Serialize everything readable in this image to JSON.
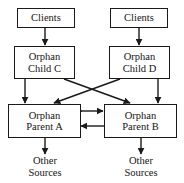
{
  "diagram": {
    "background_color": "#ffffff",
    "stroke_color": "#1a1a1a",
    "text_color": "#141414",
    "nodes": {
      "clients_left": {
        "label": "Clients",
        "boxed": true
      },
      "clients_right": {
        "label": "Clients",
        "boxed": true
      },
      "child_c": {
        "line1": "Orphan",
        "line2": "Child C",
        "boxed": true
      },
      "child_d": {
        "line1": "Orphan",
        "line2": "Child D",
        "boxed": true
      },
      "parent_a": {
        "line1": "Orphan",
        "line2": "Parent A",
        "boxed": true
      },
      "parent_b": {
        "line1": "Orphan",
        "line2": "Parent B",
        "boxed": true
      },
      "sources_left": {
        "line1": "Other",
        "line2": "Sources",
        "boxed": false
      },
      "sources_right": {
        "line1": "Other",
        "line2": "Sources",
        "boxed": false
      }
    },
    "edges": [
      {
        "id": "clients-left-to-child-c",
        "from": "clients_left",
        "to": "child_c",
        "style": "vertical",
        "arrows": "end"
      },
      {
        "id": "clients-right-to-child-d",
        "from": "clients_right",
        "to": "child_d",
        "style": "vertical",
        "arrows": "end"
      },
      {
        "id": "child-c-to-parent-a",
        "from": "child_c",
        "to": "parent_a",
        "style": "vertical",
        "arrows": "end"
      },
      {
        "id": "child-d-to-parent-b",
        "from": "child_d",
        "to": "parent_b",
        "style": "vertical",
        "arrows": "end"
      },
      {
        "id": "child-c-to-parent-b",
        "from": "child_c",
        "to": "parent_b",
        "style": "diagonal",
        "arrows": "end"
      },
      {
        "id": "child-d-to-parent-a",
        "from": "child_d",
        "to": "parent_a",
        "style": "diagonal",
        "arrows": "end"
      },
      {
        "id": "parent-a-to-parent-b",
        "from": "parent_a",
        "to": "parent_b",
        "style": "horizontal",
        "arrows": "end"
      },
      {
        "id": "parent-b-to-parent-a",
        "from": "parent_b",
        "to": "parent_a",
        "style": "horizontal",
        "arrows": "end"
      },
      {
        "id": "parent-a-to-sources-left",
        "from": "parent_a",
        "to": "sources_left",
        "style": "vertical",
        "arrows": "end"
      },
      {
        "id": "parent-b-to-sources-right",
        "from": "parent_b",
        "to": "sources_right",
        "style": "vertical",
        "arrows": "end"
      }
    ]
  }
}
